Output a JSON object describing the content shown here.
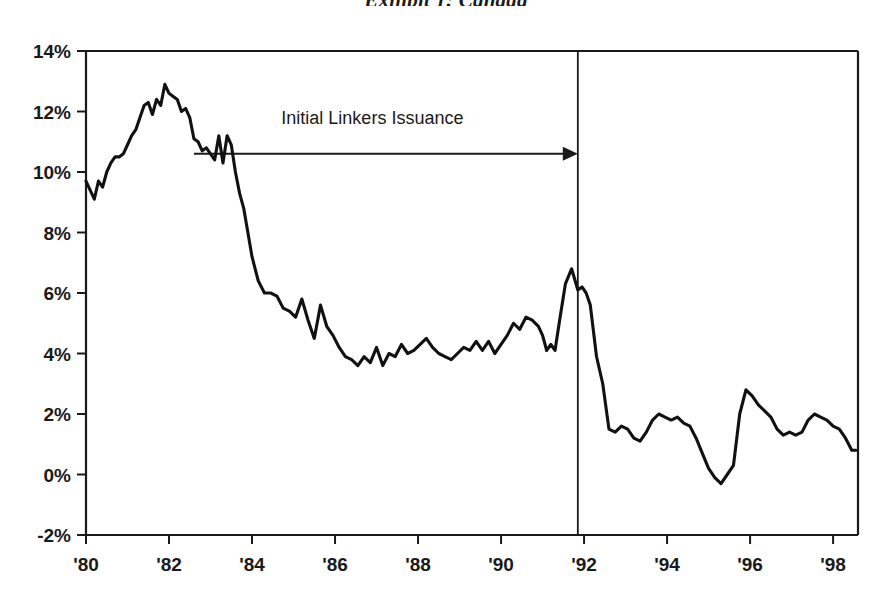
{
  "title": "Exhibit 1: Canada",
  "chart_data": {
    "type": "line",
    "title": "Exhibit 1: Canada",
    "subtitle": "",
    "xlabel": "",
    "ylabel": "",
    "xlim": [
      1980.0,
      1998.6
    ],
    "ylim": [
      -2,
      14
    ],
    "grid": false,
    "legend_position": "none",
    "y_tick_labels": [
      "14%",
      "12%",
      "10%",
      "8%",
      "6%",
      "4%",
      "2%",
      "0%",
      "-2%"
    ],
    "y_tick_values": [
      14,
      12,
      10,
      8,
      6,
      4,
      2,
      0,
      -2
    ],
    "x_tick_labels": [
      "'80",
      "'82",
      "'84",
      "'86",
      "'88",
      "'90",
      "'92",
      "'94",
      "'96",
      "'98"
    ],
    "x_tick_values": [
      1980,
      1982,
      1984,
      1986,
      1988,
      1990,
      1992,
      1994,
      1996,
      1998
    ],
    "annotations": [
      {
        "text": "Initial Linkers Issuance",
        "x": 1986.9,
        "y": 11.6,
        "arrow_from_x": 1982.6,
        "arrow_to_x": 1991.85,
        "arrow_y": 10.6
      }
    ],
    "event_lines": [
      {
        "x": 1991.85,
        "label": ""
      }
    ],
    "series": [
      {
        "name": "Canada inflation rate",
        "units": "percent",
        "x": [
          1980.0,
          1980.1,
          1980.2,
          1980.3,
          1980.4,
          1980.5,
          1980.6,
          1980.7,
          1980.8,
          1980.9,
          1981.0,
          1981.1,
          1981.2,
          1981.3,
          1981.4,
          1981.5,
          1981.6,
          1981.7,
          1981.8,
          1981.9,
          1982.0,
          1982.1,
          1982.2,
          1982.3,
          1982.4,
          1982.5,
          1982.6,
          1982.7,
          1982.8,
          1982.9,
          1983.0,
          1983.1,
          1983.2,
          1983.3,
          1983.4,
          1983.5,
          1983.6,
          1983.7,
          1983.8,
          1983.9,
          1984.0,
          1984.15,
          1984.3,
          1984.45,
          1984.6,
          1984.75,
          1984.9,
          1985.05,
          1985.2,
          1985.35,
          1985.5,
          1985.65,
          1985.8,
          1985.95,
          1986.1,
          1986.25,
          1986.4,
          1986.55,
          1986.7,
          1986.85,
          1987.0,
          1987.15,
          1987.3,
          1987.45,
          1987.6,
          1987.75,
          1987.9,
          1988.05,
          1988.2,
          1988.35,
          1988.5,
          1988.65,
          1988.8,
          1988.95,
          1989.1,
          1989.25,
          1989.4,
          1989.55,
          1989.7,
          1989.85,
          1990.0,
          1990.15,
          1990.3,
          1990.45,
          1990.6,
          1990.75,
          1990.9,
          1991.0,
          1991.1,
          1991.2,
          1991.3,
          1991.4,
          1991.55,
          1991.7,
          1991.85,
          1991.95,
          1992.05,
          1992.15,
          1992.3,
          1992.45,
          1992.6,
          1992.75,
          1992.9,
          1993.05,
          1993.2,
          1993.35,
          1993.5,
          1993.65,
          1993.8,
          1993.95,
          1994.1,
          1994.25,
          1994.4,
          1994.55,
          1994.7,
          1994.85,
          1995.0,
          1995.15,
          1995.3,
          1995.45,
          1995.6,
          1995.75,
          1995.9,
          1996.05,
          1996.2,
          1996.35,
          1996.5,
          1996.65,
          1996.8,
          1996.95,
          1997.1,
          1997.25,
          1997.4,
          1997.55,
          1997.7,
          1997.85,
          1998.0,
          1998.15,
          1998.3,
          1998.45,
          1998.55
        ],
        "y": [
          9.7,
          9.4,
          9.1,
          9.7,
          9.5,
          10.0,
          10.3,
          10.5,
          10.5,
          10.6,
          10.9,
          11.2,
          11.4,
          11.8,
          12.2,
          12.3,
          11.9,
          12.4,
          12.2,
          12.9,
          12.6,
          12.5,
          12.4,
          12.0,
          12.1,
          11.8,
          11.1,
          11.0,
          10.7,
          10.8,
          10.6,
          10.4,
          11.2,
          10.3,
          11.2,
          10.9,
          10.0,
          9.3,
          8.8,
          8.0,
          7.2,
          6.4,
          6.0,
          6.0,
          5.9,
          5.5,
          5.4,
          5.2,
          5.8,
          5.1,
          4.5,
          5.6,
          4.9,
          4.6,
          4.2,
          3.9,
          3.8,
          3.6,
          3.9,
          3.7,
          4.2,
          3.6,
          4.0,
          3.9,
          4.3,
          4.0,
          4.1,
          4.3,
          4.5,
          4.2,
          4.0,
          3.9,
          3.8,
          4.0,
          4.2,
          4.1,
          4.4,
          4.1,
          4.4,
          4.0,
          4.3,
          4.6,
          5.0,
          4.8,
          5.2,
          5.1,
          4.9,
          4.6,
          4.1,
          4.3,
          4.1,
          5.0,
          6.3,
          6.8,
          6.1,
          6.2,
          6.0,
          5.6,
          3.9,
          3.0,
          1.5,
          1.4,
          1.6,
          1.5,
          1.2,
          1.1,
          1.4,
          1.8,
          2.0,
          1.9,
          1.8,
          1.9,
          1.7,
          1.6,
          1.2,
          0.7,
          0.2,
          -0.1,
          -0.3,
          0.0,
          0.3,
          2.0,
          2.8,
          2.6,
          2.3,
          2.1,
          1.9,
          1.5,
          1.3,
          1.4,
          1.3,
          1.4,
          1.8,
          2.0,
          1.9,
          1.8,
          1.6,
          1.5,
          1.2,
          0.8,
          0.8
        ]
      }
    ]
  }
}
